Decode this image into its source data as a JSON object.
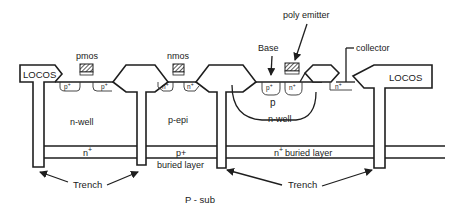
{
  "diagram": {
    "type": "semiconductor-cross-section",
    "colors": {
      "line": "#1e1e1e",
      "background": "#ffffff",
      "hatch": "#333333"
    },
    "labels": {
      "locos_left": "LOCOS",
      "locos_right": "LOCOS",
      "pmos": "pmos",
      "nmos": "nmos",
      "base": "Base",
      "poly_emitter": "poly emitter",
      "collector": "collector",
      "pmos_source": "p",
      "pmos_drain": "p",
      "nmos_source": "n",
      "nmos_drain": "n",
      "base_contact": "p",
      "emitter": "n",
      "collector_contact": "n",
      "sup_plus": "+",
      "p_base": "p",
      "nwell_left": "n-well",
      "pepi": "p-epi",
      "nwell_right": "n-well",
      "buried_left": "n",
      "buried_mid": "p+",
      "buried_mid_sub": "buried layer",
      "buried_right": "n",
      "buried_right_suffix": "buried layer",
      "trench_left": "Trench",
      "trench_right": "Trench",
      "substrate": "P - sub"
    }
  }
}
